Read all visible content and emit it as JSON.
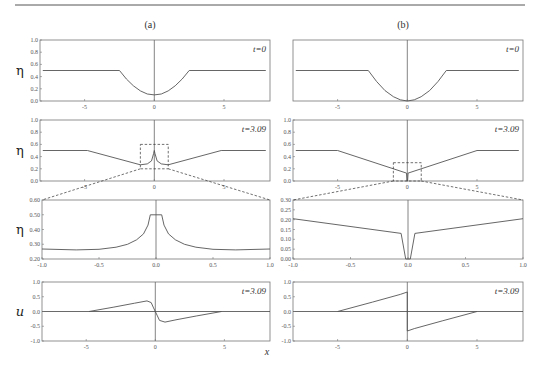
{
  "figure": {
    "panel_labels": [
      "(a)",
      "(b)"
    ],
    "x_axis_label": "x",
    "rule_line": true
  },
  "chart_data": [
    {
      "id": "a1",
      "panel": "(a)",
      "type": "line",
      "ylabel": "η",
      "annotation": "t=0",
      "xlim": [
        -8.2,
        8.3
      ],
      "ylim": [
        0,
        1.0
      ],
      "xticks": [
        -5,
        0,
        5
      ],
      "yticks": [
        0.0,
        0.2,
        0.4,
        0.6,
        0.8,
        1.0
      ],
      "ytick_labels": [
        "0.0",
        "0.2",
        "0.4",
        "0.6",
        "0.8",
        "1.0"
      ],
      "series": [
        {
          "name": "eta",
          "x": [
            -8,
            -2.5,
            -2,
            -1.5,
            -1,
            -0.5,
            0,
            0.5,
            1,
            1.5,
            2,
            2.5,
            8
          ],
          "y": [
            0.5,
            0.5,
            0.36,
            0.25,
            0.165,
            0.115,
            0.1,
            0.115,
            0.165,
            0.25,
            0.36,
            0.5,
            0.5
          ]
        }
      ]
    },
    {
      "id": "b1",
      "panel": "(b)",
      "type": "line",
      "ylabel": "",
      "annotation": "t=0",
      "xlim": [
        -8.2,
        8.3
      ],
      "ylim": [
        0,
        1.0
      ],
      "xticks": [
        -5,
        0,
        5
      ],
      "yticks": [],
      "ytick_labels": [],
      "series": [
        {
          "name": "eta",
          "x": [
            -8,
            -2.8,
            -2.2,
            -1.6,
            -1,
            -0.5,
            0,
            0.5,
            1,
            1.6,
            2.2,
            2.8,
            8
          ],
          "y": [
            0.5,
            0.5,
            0.32,
            0.17,
            0.07,
            0.02,
            0.0,
            0.02,
            0.07,
            0.17,
            0.32,
            0.5,
            0.5
          ]
        }
      ]
    },
    {
      "id": "a2",
      "panel": "(a)",
      "type": "line",
      "ylabel": "η",
      "annotation": "t=3.09",
      "xlim": [
        -8.2,
        8.3
      ],
      "ylim": [
        0,
        1.0
      ],
      "xticks": [
        -5,
        0,
        5
      ],
      "yticks": [
        0.0,
        0.2,
        0.4,
        0.6,
        0.8,
        1.0
      ],
      "ytick_labels": [
        "0.0",
        "0.2",
        "0.4",
        "0.6",
        "0.8",
        "1.0"
      ],
      "zoom_box": {
        "x": [
          -1,
          1
        ],
        "y": [
          0.2,
          0.6
        ]
      },
      "series": [
        {
          "name": "eta",
          "x": [
            -8,
            -4.8,
            -1,
            -0.5,
            -0.2,
            -0.05,
            0,
            0.05,
            0.2,
            0.5,
            1,
            4.8,
            8
          ],
          "y": [
            0.5,
            0.5,
            0.265,
            0.28,
            0.33,
            0.45,
            0.5,
            0.45,
            0.33,
            0.28,
            0.265,
            0.5,
            0.5
          ]
        }
      ]
    },
    {
      "id": "b2",
      "panel": "(b)",
      "type": "line",
      "ylabel": "",
      "annotation": "t=3.09",
      "xlim": [
        -8.2,
        8.3
      ],
      "ylim": [
        0,
        1.0
      ],
      "xticks": [
        -5,
        0,
        5
      ],
      "yticks": [
        0.0,
        0.2,
        0.4,
        0.6,
        0.8,
        1.0
      ],
      "ytick_labels": [
        "0.0",
        "0.2",
        "0.4",
        "0.6",
        "0.8",
        "1.0"
      ],
      "zoom_box": {
        "x": [
          -1,
          1
        ],
        "y": [
          0,
          0.3
        ]
      },
      "series": [
        {
          "name": "eta",
          "x": [
            -8,
            -5,
            -0.06,
            -0.02,
            0,
            0.02,
            0.06,
            5,
            8
          ],
          "y": [
            0.5,
            0.5,
            0.13,
            0.0,
            0.0,
            0.0,
            0.13,
            0.5,
            0.5
          ]
        }
      ]
    },
    {
      "id": "a3",
      "panel": "(a)",
      "type": "line",
      "ylabel": "η",
      "annotation": "",
      "xlim": [
        -1.0,
        1.0
      ],
      "ylim": [
        0.2,
        0.6
      ],
      "xticks": [
        -1.0,
        -0.5,
        0.0,
        0.5,
        1.0
      ],
      "yticks": [
        0.2,
        0.3,
        0.4,
        0.5,
        0.6
      ],
      "xtick_labels": [
        "-1.0",
        "-0.5",
        "0.0",
        "0.5",
        "1.0"
      ],
      "ytick_labels": [
        "0.20",
        "0.30",
        "0.40",
        "0.50",
        "0.60"
      ],
      "series": [
        {
          "name": "eta",
          "x": [
            -1,
            -0.7,
            -0.5,
            -0.35,
            -0.25,
            -0.17,
            -0.11,
            -0.07,
            -0.05,
            0.05,
            0.07,
            0.11,
            0.17,
            0.25,
            0.35,
            0.5,
            0.7,
            1
          ],
          "y": [
            0.268,
            0.262,
            0.266,
            0.28,
            0.3,
            0.33,
            0.37,
            0.43,
            0.5,
            0.5,
            0.43,
            0.37,
            0.33,
            0.3,
            0.28,
            0.266,
            0.262,
            0.268
          ]
        }
      ]
    },
    {
      "id": "b3",
      "panel": "(b)",
      "type": "line",
      "ylabel": "",
      "annotation": "",
      "xlim": [
        -1.0,
        1.0
      ],
      "ylim": [
        0.0,
        0.3
      ],
      "xticks": [
        -1.0,
        -0.5,
        0.0,
        0.5,
        1.0
      ],
      "yticks": [
        0,
        0.05,
        0.1,
        0.15,
        0.2,
        0.25,
        0.3
      ],
      "xtick_labels": [
        "-1.0",
        "-0.5",
        "0.0",
        "0.5",
        "1.0"
      ],
      "ytick_labels": [
        "0.00",
        "0.05",
        "0.10",
        "0.15",
        "0.20",
        "0.25",
        "0.30"
      ],
      "series": [
        {
          "name": "eta",
          "x": [
            -1,
            -0.06,
            -0.02,
            0.02,
            0.06,
            1
          ],
          "y": [
            0.205,
            0.13,
            0.0,
            0.0,
            0.13,
            0.205
          ]
        }
      ]
    },
    {
      "id": "a4",
      "panel": "(a)",
      "type": "line",
      "ylabel": "u",
      "annotation": "t=3.09",
      "xlim": [
        -8.2,
        8.3
      ],
      "ylim": [
        -1.0,
        1.0
      ],
      "xticks": [
        -5,
        0,
        5
      ],
      "yticks": [
        -1.0,
        -0.5,
        0.0,
        0.5,
        1.0
      ],
      "ytick_labels": [
        "-1.0",
        "-0.5",
        "0.0",
        "0.5",
        "1.0"
      ],
      "series": [
        {
          "name": "u",
          "x": [
            -4.8,
            -3,
            -1.5,
            -0.6,
            -0.3,
            -0.15,
            0,
            0.15,
            0.3,
            0.7,
            1.5,
            3,
            4.8
          ],
          "y": [
            0,
            0.15,
            0.28,
            0.36,
            0.3,
            0.15,
            0,
            -0.15,
            -0.3,
            -0.36,
            -0.28,
            -0.15,
            0
          ]
        }
      ]
    },
    {
      "id": "b4",
      "panel": "(b)",
      "type": "line",
      "ylabel": "",
      "annotation": "t=3.09",
      "xlim": [
        -8.2,
        8.3
      ],
      "ylim": [
        -1.0,
        1.0
      ],
      "xticks": [
        -5,
        0,
        5
      ],
      "yticks": [
        -1.0,
        -0.5,
        0.0,
        0.5,
        1.0
      ],
      "ytick_labels": [
        "-1.0",
        "-0.5",
        "0.0",
        "0.5",
        "1.0"
      ],
      "series": [
        {
          "name": "u",
          "x": [
            -5,
            -2.5,
            -0.5,
            0,
            0,
            0.5,
            2.5,
            5
          ],
          "y": [
            0,
            0.32,
            0.58,
            0.66,
            -0.66,
            -0.58,
            -0.32,
            0
          ]
        }
      ]
    }
  ]
}
